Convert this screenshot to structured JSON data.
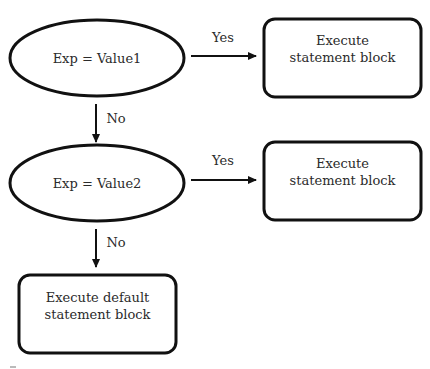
{
  "diagram": {
    "type": "flowchart",
    "nodes": {
      "decision1": {
        "shape": "ellipse",
        "label": "Exp = Value1"
      },
      "decision2": {
        "shape": "ellipse",
        "label": "Exp = Value2"
      },
      "action1": {
        "shape": "rounded-rectangle",
        "line1": "Execute",
        "line2": "statement block"
      },
      "action2": {
        "shape": "rounded-rectangle",
        "line1": "Execute",
        "line2": "statement block"
      },
      "default": {
        "shape": "rounded-rectangle",
        "line1": "Execute default",
        "line2": "statement block"
      }
    },
    "edges": {
      "d1_yes": {
        "from": "decision1",
        "to": "action1",
        "label": "Yes"
      },
      "d1_no": {
        "from": "decision1",
        "to": "decision2",
        "label": "No"
      },
      "d2_yes": {
        "from": "decision2",
        "to": "action2",
        "label": "Yes"
      },
      "d2_no": {
        "from": "decision2",
        "to": "default",
        "label": "No"
      }
    },
    "colors": {
      "stroke": "#111111",
      "text": "#2b2b2b",
      "background": "#ffffff"
    }
  }
}
